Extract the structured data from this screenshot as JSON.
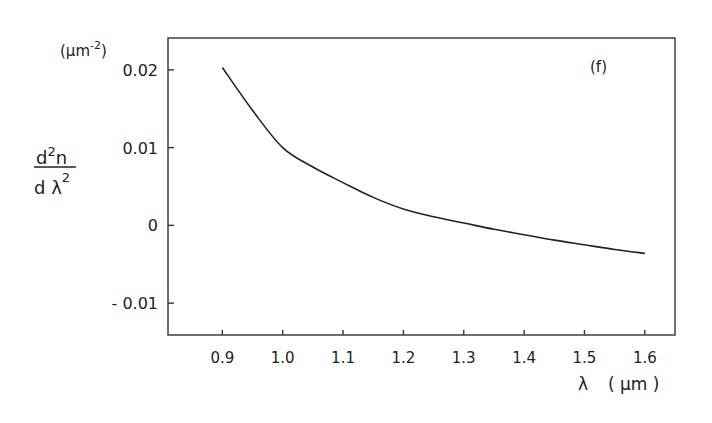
{
  "chart_data": {
    "type": "line",
    "title": "",
    "panel_label": "(f)",
    "xlabel": "λ (μm)",
    "ylabel": "d²n / dλ²",
    "yunit": "(μm⁻²)",
    "xlim": [
      0.81,
      1.65
    ],
    "ylim": [
      -0.0141,
      0.0241
    ],
    "x_ticks": [
      "0.9",
      "1.0",
      "1.1",
      "1.2",
      "1.3",
      "1.4",
      "1.5",
      "1.6"
    ],
    "y_ticks": [
      "0.02",
      "0.01",
      "0",
      "- 0.01"
    ],
    "grid": false,
    "legend": null,
    "series": [
      {
        "name": "d2n/dlambda2",
        "x": [
          0.9,
          0.95,
          1.0,
          1.05,
          1.1,
          1.15,
          1.2,
          1.25,
          1.3,
          1.35,
          1.4,
          1.45,
          1.5,
          1.55,
          1.6
        ],
        "values": [
          0.0203,
          0.0148,
          0.01,
          0.0075,
          0.0055,
          0.0036,
          0.0021,
          0.0011,
          0.0003,
          -0.0005,
          -0.0012,
          -0.0019,
          -0.0025,
          -0.0031,
          -0.0036
        ]
      }
    ]
  },
  "labels": {
    "yunit_base": "(μm",
    "yunit_exp": "-2",
    "yunit_close": ")",
    "ylabel_num": "d",
    "ylabel_num_exp": "2",
    "ylabel_num_n": "n",
    "ylabel_den": "d λ",
    "ylabel_den_exp": "2",
    "xlabel_sym": "λ",
    "xlabel_unit": "( μm )",
    "panel": "(f)"
  }
}
